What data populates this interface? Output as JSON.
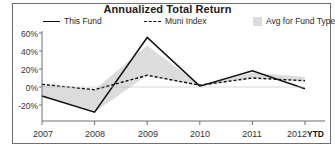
{
  "chart_data": {
    "type": "line",
    "title": "Annualized Total Return",
    "xlabel": "",
    "ylabel": "",
    "categories": [
      "2007",
      "2008",
      "2009",
      "2010",
      "2011",
      "2012"
    ],
    "x_axis_note": "YTD",
    "ytick_labels": [
      "60%",
      "40%",
      "20%",
      "0%",
      "-20%"
    ],
    "ytick_values": [
      60,
      40,
      20,
      0,
      -20
    ],
    "ylim": [
      -30,
      62
    ],
    "grid": false,
    "legend_position": "top",
    "series": [
      {
        "name": "This Fund",
        "style": "solid",
        "color": "#111111",
        "values": [
          -10,
          -28,
          55,
          1,
          18,
          -2
        ]
      },
      {
        "name": "Muni Index",
        "style": "dashed",
        "color": "#111111",
        "values": [
          3,
          -3,
          13,
          2,
          10,
          7
        ]
      },
      {
        "name": "Avg for Fund Type",
        "style": "area-band",
        "color": "#dcdcdc",
        "values_upper": [
          3,
          -3,
          46,
          2,
          16,
          11
        ],
        "values_lower": [
          -10,
          -28,
          13,
          1,
          10,
          7
        ]
      }
    ]
  },
  "legend": {
    "items": [
      {
        "label": "This Fund",
        "swatch": "solid-line-swatch"
      },
      {
        "label": "Muni Index",
        "swatch": "dashed-line-swatch"
      },
      {
        "label": "Avg for Fund Type",
        "swatch": "area-swatch"
      }
    ]
  }
}
